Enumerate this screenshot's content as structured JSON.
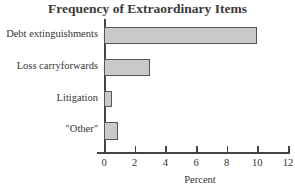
{
  "chart_data": {
    "type": "bar",
    "orientation": "horizontal",
    "title": "Frequency of Extraordinary Items",
    "xlabel": "Percent",
    "ylabel": "",
    "categories": [
      "Debt extinguishments",
      "Loss carryforwards",
      "Litigation",
      "\"Other\""
    ],
    "values": [
      10.0,
      3.0,
      0.5,
      0.9
    ],
    "xlim": [
      0,
      12
    ],
    "xticks": [
      0,
      2,
      4,
      6,
      8,
      10,
      12
    ],
    "grid": false,
    "legend": null
  },
  "colors": {
    "bar_fill": "#c9c9c9",
    "bar_border": "#555555",
    "axis": "#444444"
  }
}
